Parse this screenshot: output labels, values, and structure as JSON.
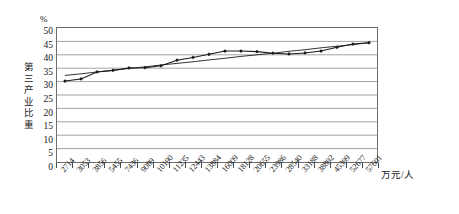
{
  "chart_data": {
    "type": "line",
    "title": "",
    "subtitle": "",
    "xlabel": "万元/人",
    "ylabel": "第三产业比重",
    "yunit": "%",
    "ylim": [
      0,
      50
    ],
    "ytick_step": 5,
    "yticks": [
      50,
      45,
      40,
      35,
      30,
      25,
      20,
      15,
      10,
      5,
      0
    ],
    "grid": true,
    "legend": "none",
    "categories": [
      "2714",
      "3053",
      "3856",
      "5455",
      "7436",
      "9089",
      "10190",
      "11235",
      "12443",
      "13884",
      "16009",
      "18128",
      "20655",
      "23986",
      "28540",
      "33188",
      "38892",
      "45399",
      "52677",
      "57601"
    ],
    "series": [
      {
        "name": "第三产业比重",
        "marker": "diamond",
        "values": [
          30.2,
          31.0,
          33.6,
          34.2,
          35.1,
          35.2,
          35.9,
          38.0,
          39.0,
          40.2,
          41.4,
          41.4,
          41.2,
          40.6,
          40.3,
          40.7,
          41.4,
          42.8,
          44.0,
          44.5
        ]
      },
      {
        "name": "线性趋势线",
        "marker": "none",
        "trendline": true,
        "values": [
          32.3,
          32.9,
          33.6,
          34.2,
          34.9,
          35.5,
          36.2,
          36.8,
          37.4,
          38.1,
          38.7,
          39.4,
          40.0,
          40.6,
          41.3,
          41.9,
          42.6,
          43.2,
          43.8,
          44.5
        ]
      }
    ],
    "colors": {
      "series_line": "#1a1a1a",
      "trend_line": "#1a1a1a",
      "grid": "#8a8a8a",
      "frame": "#6e6e6e",
      "text": "#141414"
    }
  },
  "ylabel_chars": [
    "第",
    "三",
    "产",
    "业",
    "比",
    "重"
  ]
}
